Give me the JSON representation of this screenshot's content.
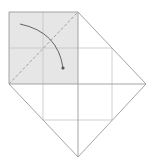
{
  "diagram": {
    "type": "origami-fold-step",
    "colors": {
      "background": "#ffffff",
      "shaded_face": "#e6e6e6",
      "outline": "#9a9a9a",
      "grid": "#c4c4c4",
      "valley_fold": "#a0a0a0",
      "arrow": "#555555"
    },
    "shaded_square": {
      "x": 9,
      "y": 12,
      "w": 69,
      "h": 72
    },
    "outline_points": [
      [
        9,
        12
      ],
      [
        78,
        12
      ],
      [
        146,
        84
      ],
      [
        78,
        157
      ],
      [
        9,
        84
      ]
    ],
    "grid_lines": [
      {
        "x1": 43,
        "y1": 12,
        "x2": 43,
        "y2": 120
      },
      {
        "x1": 112,
        "y1": 48,
        "x2": 112,
        "y2": 120
      },
      {
        "x1": 9,
        "y1": 48,
        "x2": 112,
        "y2": 48
      },
      {
        "x1": 43,
        "y1": 120,
        "x2": 112,
        "y2": 120
      }
    ],
    "center_lines": [
      {
        "x1": 78,
        "y1": 12,
        "x2": 78,
        "y2": 157
      },
      {
        "x1": 9,
        "y1": 84,
        "x2": 146,
        "y2": 84
      }
    ],
    "valley_fold_line": {
      "x1": 9,
      "y1": 84,
      "x2": 78,
      "y2": 12
    },
    "fold_arrow": {
      "path": "M20 24 Q58 32 63 68",
      "end_dot": {
        "cx": 63,
        "cy": 68,
        "r": 1.6
      }
    }
  }
}
